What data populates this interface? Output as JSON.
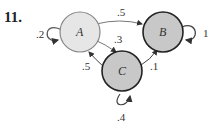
{
  "problem_number": "11.",
  "nodes": [
    {
      "id": "A",
      "label": "A",
      "fill": "#e6e6e6",
      "stroke": "#888888"
    },
    {
      "id": "B",
      "label": "B",
      "fill": "#c8c8c8",
      "stroke": "#222222"
    },
    {
      "id": "C",
      "label": "C",
      "fill": "#c8c8c8",
      "stroke": "#222222"
    }
  ],
  "edges": [
    {
      "from": "A",
      "to": "A",
      "label": ".2"
    },
    {
      "from": "A",
      "to": "B",
      "label": ".5"
    },
    {
      "from": "A",
      "to": "C",
      "label": ".3"
    },
    {
      "from": "B",
      "to": "B",
      "label": "1"
    },
    {
      "from": "C",
      "to": "A",
      "label": ".5"
    },
    {
      "from": "C",
      "to": "B",
      "label": ".1"
    },
    {
      "from": "C",
      "to": "C",
      "label": ".4"
    }
  ]
}
